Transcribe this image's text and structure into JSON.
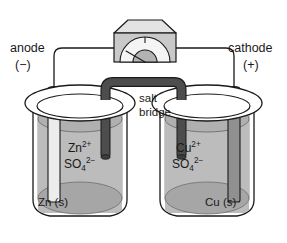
{
  "diagram": {
    "background_color": "#ffffff",
    "stroke_color": "#1a1a1a"
  },
  "labels": {
    "anode": "anode",
    "anode_sign": "(−)",
    "cathode": "cathode",
    "cathode_sign": "(+)",
    "salt_bridge_line1": "salt",
    "salt_bridge_line2": "bridge"
  },
  "left_cell": {
    "electrode_name": "Zn",
    "electrode_color": "#e8e8e8",
    "solid_label": "Zn (s)",
    "cation_element": "Zn",
    "cation_charge": "2+",
    "anion_formula": "SO",
    "anion_subscript": "4",
    "anion_charge": "2−",
    "solution_color": "#b8b8b8",
    "surface_color": "#a8a8a8"
  },
  "right_cell": {
    "electrode_name": "Cu",
    "electrode_color": "#8f8f8f",
    "solid_label": "Cu (s)",
    "cation_element": "Cu",
    "cation_charge": "2+",
    "anion_formula": "SO",
    "anion_subscript": "4",
    "anion_charge": "2−",
    "solution_color": "#b8b8b8",
    "surface_color": "#a8a8a8"
  },
  "salt_bridge": {
    "color": "#4a4a4a",
    "shape": "inverted-u-tube"
  },
  "meter": {
    "type": "voltmeter",
    "body_color": "#c9c9c9",
    "top_color": "#e0e0e0",
    "dial_color": "#f2f2f2",
    "dial_inner_color": "#b5b5b5",
    "needle_direction": "upper-left"
  },
  "wires": {
    "color": "#1a1a1a",
    "left_connects": "anode electrode to meter left terminal",
    "right_connects": "meter right terminal to cathode electrode"
  }
}
